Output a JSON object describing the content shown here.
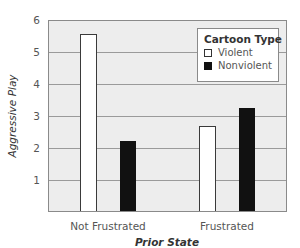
{
  "chart_data": {
    "type": "bar",
    "title": "",
    "xlabel": "Prior State",
    "ylabel": "Aggressive Play",
    "categories": [
      "Not Frustrated",
      "Frustrated"
    ],
    "series": [
      {
        "name": "Violent",
        "values": [
          5.6,
          2.7
        ],
        "color": "#ffffff",
        "edge": "#3a3a3a"
      },
      {
        "name": "Nonviolent",
        "values": [
          2.2,
          3.25
        ],
        "color": "#111111"
      }
    ],
    "ylim": [
      0,
      6
    ],
    "yticks": [
      1,
      2,
      3,
      4,
      5,
      6
    ],
    "grid": true,
    "legend": {
      "title": "Cartoon Type",
      "position": "upper right",
      "entries": [
        "Violent",
        "Nonviolent"
      ]
    }
  },
  "colors": {
    "plot_background": "#ededed",
    "gridline": "#9a9a9a",
    "violent_fill": "#ffffff",
    "nonviolent_fill": "#111111"
  }
}
